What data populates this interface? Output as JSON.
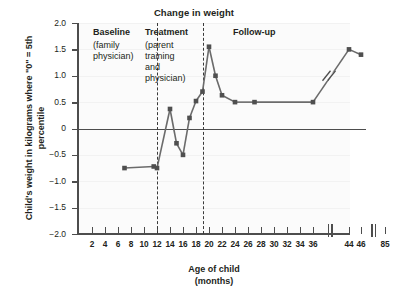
{
  "chart_data": {
    "type": "line",
    "title": "Change in weight",
    "xlabel": "Age of child",
    "xlabel_unit": "(months)",
    "ylabel": "Child's weight in kilograms where \"0\" = 5th percentile",
    "ylim": [
      -2.0,
      2.0
    ],
    "ytick_labels": [
      "2.0",
      "1.5",
      "1.0",
      "0.5",
      "0",
      "−0.5",
      "−1.0",
      "−1.5",
      "−2.0"
    ],
    "ytick_values": [
      2.0,
      1.5,
      1.0,
      0.5,
      0,
      -0.5,
      -1.0,
      -1.5,
      -2.0
    ],
    "xtick_labels": [
      "2",
      "4",
      "6",
      "8",
      "10",
      "12",
      "14",
      "16",
      "18",
      "20",
      "22",
      "24",
      "26",
      "28",
      "30",
      "32",
      "34",
      "36",
      "44",
      "46",
      "85"
    ],
    "xtick_values": [
      2,
      4,
      6,
      8,
      10,
      12,
      14,
      16,
      18,
      20,
      22,
      24,
      26,
      28,
      30,
      32,
      34,
      36,
      44,
      46,
      85
    ],
    "axis_breaks": [
      "between 36 and 44",
      "between 46 and 85"
    ],
    "grid": true,
    "legend": "none",
    "zero_reference_line": 0,
    "series": [
      {
        "name": "Child's weight",
        "x": [
          7,
          11.5,
          12,
          14,
          15,
          16,
          17,
          18,
          19,
          20,
          21,
          22,
          24,
          27,
          36,
          44,
          46
        ],
        "y": [
          -0.75,
          -0.72,
          -0.75,
          0.37,
          -0.28,
          -0.5,
          0.2,
          0.52,
          0.7,
          1.55,
          1.0,
          0.63,
          0.5,
          0.5,
          0.5,
          1.5,
          1.4
        ]
      }
    ],
    "phases": [
      {
        "name": "Baseline",
        "detail": "(family physician)",
        "start": 2,
        "end": 12
      },
      {
        "name": "Treatment",
        "detail": "(parent training and physician)",
        "start": 12,
        "end": 19
      },
      {
        "name": "Follow-up",
        "detail": "",
        "start": 19,
        "end": 85
      }
    ],
    "phase_divider_x": [
      12,
      19
    ],
    "colors": {
      "line": "#6b6b6b",
      "marker": "#4f4f4f",
      "axis": "#4d4d4d",
      "plot_bg": "#fbfbfb"
    }
  },
  "phase_labels": {
    "baseline_title": "Baseline",
    "baseline_line1": "(family",
    "baseline_line2": "physician)",
    "treatment_title": "Treatment",
    "treatment_line1": "(parent",
    "treatment_line2": "training",
    "treatment_line3": "and",
    "treatment_line4": "physician)",
    "followup_title": "Follow-up"
  }
}
